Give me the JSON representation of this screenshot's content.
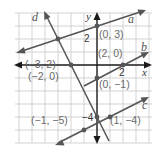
{
  "diagram": {
    "type": "coordinate-plane-lines",
    "grid": {
      "x_min": -6,
      "x_max": 4,
      "y_min": -6,
      "y_max": 4,
      "cell_px": 13,
      "origin_px": [
        97,
        65
      ]
    },
    "axes": {
      "x_label": "x",
      "y_label": "y",
      "x_tick_label": "2",
      "y_tick_labels": [
        "2",
        "−4"
      ]
    },
    "lines": [
      {
        "name": "a",
        "label": "a",
        "through": [
          [
            -3,
            2
          ],
          [
            0,
            3
          ]
        ]
      },
      {
        "name": "b",
        "label": "b",
        "through": [
          [
            0,
            -1
          ],
          [
            2,
            0
          ]
        ]
      },
      {
        "name": "c",
        "label": "c",
        "through": [
          [
            -1,
            -5
          ],
          [
            1,
            -4
          ]
        ]
      },
      {
        "name": "d",
        "label": "d",
        "through": [
          [
            -2,
            0
          ],
          [
            0,
            -4
          ]
        ]
      }
    ],
    "points": [
      {
        "id": "p-0-3",
        "label": "(0, 3)",
        "x": 0,
        "y": 3
      },
      {
        "id": "p-2-0",
        "label": "(2, 0)",
        "x": 2,
        "y": 0
      },
      {
        "id": "p-m3-2",
        "label": "(−3, 2)",
        "x": -3,
        "y": 2
      },
      {
        "id": "p-m2-0",
        "label": "(−2, 0)",
        "x": -2,
        "y": 0
      },
      {
        "id": "p-0-m1",
        "label": "(0, −1)",
        "x": 0,
        "y": -1
      },
      {
        "id": "p-m1-m5",
        "label": "(−1, −5)",
        "x": -1,
        "y": -5
      },
      {
        "id": "p-1-m4",
        "label": "(1, −4)",
        "x": 1,
        "y": -4
      }
    ]
  }
}
